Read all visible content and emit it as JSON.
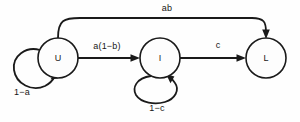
{
  "diagram": {
    "type": "state-transition-diagram",
    "background_color": "#fefefe",
    "stroke_color": "#1a1a1a",
    "nodes": [
      {
        "id": "U",
        "label": "U",
        "cx": 58,
        "cy": 58,
        "r": 20
      },
      {
        "id": "I",
        "label": "I",
        "cx": 160,
        "cy": 58,
        "r": 20
      },
      {
        "id": "L",
        "label": "L",
        "cx": 266,
        "cy": 58,
        "r": 20
      }
    ],
    "edges": [
      {
        "id": "u-to-i",
        "from": "U",
        "to": "I",
        "label": "a(1−b)",
        "label_x": 107,
        "label_y": 46,
        "kind": "straight"
      },
      {
        "id": "i-to-l",
        "from": "I",
        "to": "L",
        "label": "c",
        "label_x": 218,
        "label_y": 45,
        "kind": "straight"
      },
      {
        "id": "u-to-l",
        "from": "U",
        "to": "L",
        "label": "ab",
        "label_x": 167,
        "label_y": 8,
        "kind": "arc-over"
      },
      {
        "id": "u-self",
        "from": "U",
        "to": "U",
        "label": "1−a",
        "label_x": 22,
        "label_y": 92,
        "kind": "self-loop-left"
      },
      {
        "id": "i-self",
        "from": "I",
        "to": "I",
        "label": "1−c",
        "label_x": 157,
        "label_y": 108,
        "kind": "self-loop-bottom"
      }
    ]
  }
}
